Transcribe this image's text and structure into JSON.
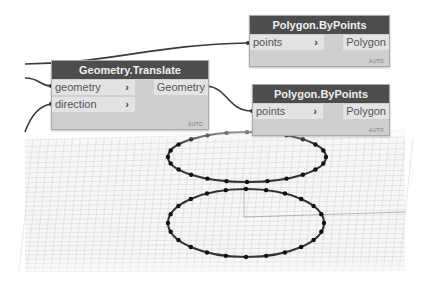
{
  "nodes": {
    "polygon_top": {
      "title": "Polygon.ByPoints",
      "inputs": [
        {
          "label": "points",
          "chevron": "›"
        }
      ],
      "output": "Polygon",
      "lacing": "AUTO"
    },
    "translate": {
      "title": "Geometry.Translate",
      "inputs": [
        {
          "label": "geometry",
          "chevron": "›"
        },
        {
          "label": "direction",
          "chevron": "›"
        }
      ],
      "output": "Geometry",
      "lacing": "AUTO"
    },
    "polygon_bottom": {
      "title": "Polygon.ByPoints",
      "inputs": [
        {
          "label": "points",
          "chevron": "›"
        }
      ],
      "output": "Polygon",
      "lacing": "AUTO"
    }
  },
  "preview": {
    "shapes": [
      "upper-polygon-ellipse",
      "lower-polygon-ellipse"
    ],
    "points_per_polygon": 24
  },
  "colors": {
    "node_header": "#4d4d4d",
    "node_body": "#cfcfcf",
    "wire": "#3a3a3a",
    "grid": "#dcdcdc"
  }
}
